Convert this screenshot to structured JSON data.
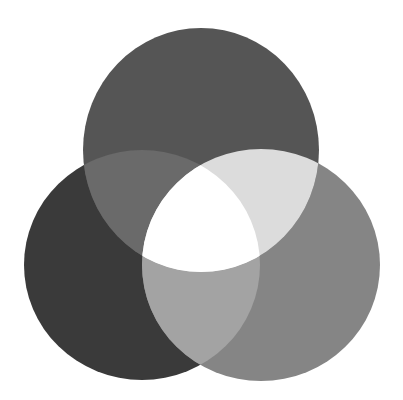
{
  "diagram": {
    "type": "three-circle-venn",
    "background": "#ffffff",
    "circles": [
      {
        "id": "top",
        "cx": 201,
        "cy": 150,
        "rx": 118,
        "ry": 122,
        "color": "#555555"
      },
      {
        "id": "left",
        "cx": 142,
        "cy": 265,
        "rx": 118,
        "ry": 115,
        "color": "#3a3a3a"
      },
      {
        "id": "right",
        "cx": 261,
        "cy": 265,
        "rx": 119,
        "ry": 116,
        "color": "#858585"
      }
    ],
    "overlaps": {
      "top_left": "#6a6a6a",
      "top_right": "#dcdcdc",
      "left_right": "#a3a3a3",
      "all_three": "#ffffff"
    }
  }
}
